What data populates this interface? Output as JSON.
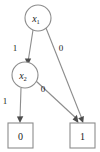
{
  "figure": {
    "name": "binary-decision-diagram",
    "background_color": "#ffffff",
    "stroke_color": "#8c8c8c",
    "text_color": "#1a1a1a",
    "arrow_color": "#4d4d4d",
    "width": 100,
    "height": 152
  },
  "nodes": {
    "root": {
      "id": "x1",
      "label": "x",
      "subscript": "1",
      "shape": "circle",
      "cx": 38,
      "cy": 18,
      "r": 13
    },
    "internal": {
      "id": "x2",
      "label": "x",
      "subscript": "2",
      "shape": "circle",
      "cx": 25,
      "cy": 75,
      "r": 13
    },
    "terminal_false": {
      "id": "t0",
      "label": "0",
      "shape": "square",
      "x": 8,
      "y": 123,
      "w": 25,
      "h": 25
    },
    "terminal_true": {
      "id": "t1",
      "label": "1",
      "shape": "square",
      "x": 70,
      "y": 123,
      "w": 25,
      "h": 25
    }
  },
  "edges": [
    {
      "name": "edge-x1-high-to-x2",
      "from": "x1",
      "to": "x2",
      "label": "1",
      "label_x": 15,
      "label_y": 48,
      "x1": 33,
      "y1": 30,
      "x2": 28,
      "y2": 62
    },
    {
      "name": "edge-x1-low-to-terminal-1",
      "from": "x1",
      "to": "t1",
      "label": "0",
      "label_x": 61,
      "label_y": 48,
      "x1": 45,
      "y1": 29,
      "x2": 82,
      "y2": 122
    },
    {
      "name": "edge-x2-high-to-terminal-0",
      "from": "x2",
      "to": "t0",
      "label": "1",
      "label_x": 5,
      "label_y": 101,
      "x1": 21,
      "y1": 88,
      "x2": 20,
      "y2": 122
    },
    {
      "name": "edge-x2-low-to-terminal-1",
      "from": "x2",
      "to": "t1",
      "label": "0",
      "label_x": 43,
      "label_y": 89,
      "x1": 36,
      "y1": 81,
      "x2": 77,
      "y2": 122
    }
  ]
}
